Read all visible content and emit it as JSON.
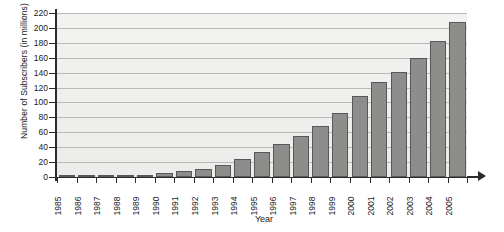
{
  "chart_data": {
    "type": "bar",
    "title": "",
    "xlabel": "Year",
    "ylabel": "Number of Subscribers (in millions)",
    "ylim": [
      0,
      220
    ],
    "ytick_step": 20,
    "yticks": [
      0,
      20,
      40,
      60,
      80,
      100,
      120,
      140,
      160,
      180,
      200,
      220
    ],
    "grid": true,
    "legend": "none",
    "bar_color": "#8d8d8b",
    "bar_edge_color": "#58585a",
    "plot_background": "#eeeeec",
    "axis_color": "#2b2b2b",
    "categories": [
      "1985",
      "1986",
      "1987",
      "1988",
      "1989",
      "1990",
      "1991",
      "1992",
      "1993",
      "1994",
      "1995",
      "1996",
      "1997",
      "1998",
      "1999",
      "2000",
      "2001",
      "2002",
      "2003",
      "2004",
      "2005"
    ],
    "values": [
      1,
      1,
      2,
      2,
      3,
      5,
      8,
      11,
      16,
      24,
      34,
      44,
      55,
      69,
      86,
      109,
      128,
      141,
      159,
      182,
      208
    ]
  },
  "labels": {
    "y_axis_title": "Number of Subscribers (in millions)",
    "x_axis_title": "Year"
  }
}
